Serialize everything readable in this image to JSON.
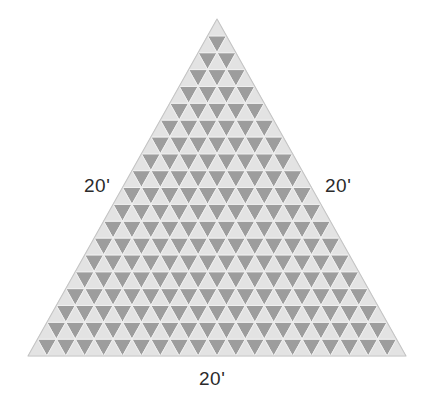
{
  "figure": {
    "name": "equilateral-triangle-subdivided-grid",
    "shape": "equilateral-triangle",
    "subdivisions_per_side": 20,
    "rows": 20,
    "upward_triangle_count": 400,
    "downward_triangle_count": 361,
    "total_small_triangles": 761,
    "colors": {
      "background": "#ffffff",
      "upward_fill": "#e3e3e3",
      "downward_fill": "#9d9d9d",
      "grid_stroke": "#f2f2f2",
      "outline": "#bdbdbd",
      "label_text": "#2b2b2b"
    },
    "geometry": {
      "apex_x": 217,
      "apex_y": 19,
      "bottom_left_x": 28,
      "bottom_left_y": 356,
      "bottom_right_x": 406,
      "bottom_right_y": 356,
      "side_length_px": 378,
      "height_px": 337
    }
  },
  "labels": {
    "left": "20'",
    "right": "20'",
    "bottom": "20'"
  },
  "chart_data": {
    "type": "diagram",
    "title": "",
    "sides": [
      {
        "position": "left",
        "label": "20'",
        "value": 20,
        "unit": "feet"
      },
      {
        "position": "right",
        "label": "20'",
        "value": 20,
        "unit": "feet"
      },
      {
        "position": "bottom",
        "label": "20'",
        "value": 20,
        "unit": "feet"
      }
    ]
  }
}
